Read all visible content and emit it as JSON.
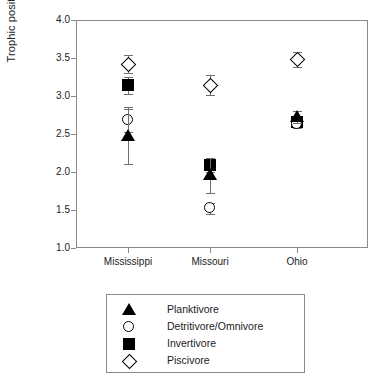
{
  "chart_data": {
    "type": "scatter",
    "title": "",
    "subtitle": "",
    "xlabel": "",
    "ylabel": "Trophic position",
    "categories": [
      "Mississippi",
      "Missouri",
      "Ohio"
    ],
    "ylim": [
      1.0,
      4.0
    ],
    "ytick_labels": [
      "1.0",
      "1.5",
      "2.0",
      "2.5",
      "3.0",
      "3.5",
      "4.0"
    ],
    "ytick_values": [
      1.0,
      1.5,
      2.0,
      2.5,
      3.0,
      3.5,
      4.0
    ],
    "grid": false,
    "legend_position": "below-plot",
    "error_bars": "vertical, symmetric caps",
    "series": [
      {
        "name": "Planktivore",
        "marker": "filled-triangle",
        "color": "#000000",
        "filled": true,
        "values": [
          2.48,
          1.96,
          2.72
        ],
        "errors": [
          0.38,
          0.23,
          0.08
        ]
      },
      {
        "name": "Detritivore/Omnivore",
        "marker": "open-circle",
        "color": "#000000",
        "filled": false,
        "values": [
          2.68,
          1.52,
          2.63
        ],
        "errors": [
          0.15,
          0.07,
          0.05
        ]
      },
      {
        "name": "Invertivore",
        "marker": "filled-square",
        "color": "#000000",
        "filled": true,
        "values": [
          3.14,
          2.09,
          2.66
        ],
        "errors": [
          0.11,
          0.09,
          0.06
        ]
      },
      {
        "name": "Piscivore",
        "marker": "open-diamond",
        "color": "#000000",
        "filled": false,
        "values": [
          3.42,
          3.14,
          3.48
        ],
        "errors": [
          0.12,
          0.13,
          0.1
        ]
      }
    ]
  },
  "axes": {
    "y_title": "Trophic position"
  },
  "legend": {
    "entries": [
      {
        "label": "Planktivore",
        "marker": "filled-triangle"
      },
      {
        "label": "Detritivore/Omnivore",
        "marker": "open-circle"
      },
      {
        "label": "Invertivore",
        "marker": "filled-square"
      },
      {
        "label": "Piscivore",
        "marker": "open-diamond"
      }
    ]
  }
}
